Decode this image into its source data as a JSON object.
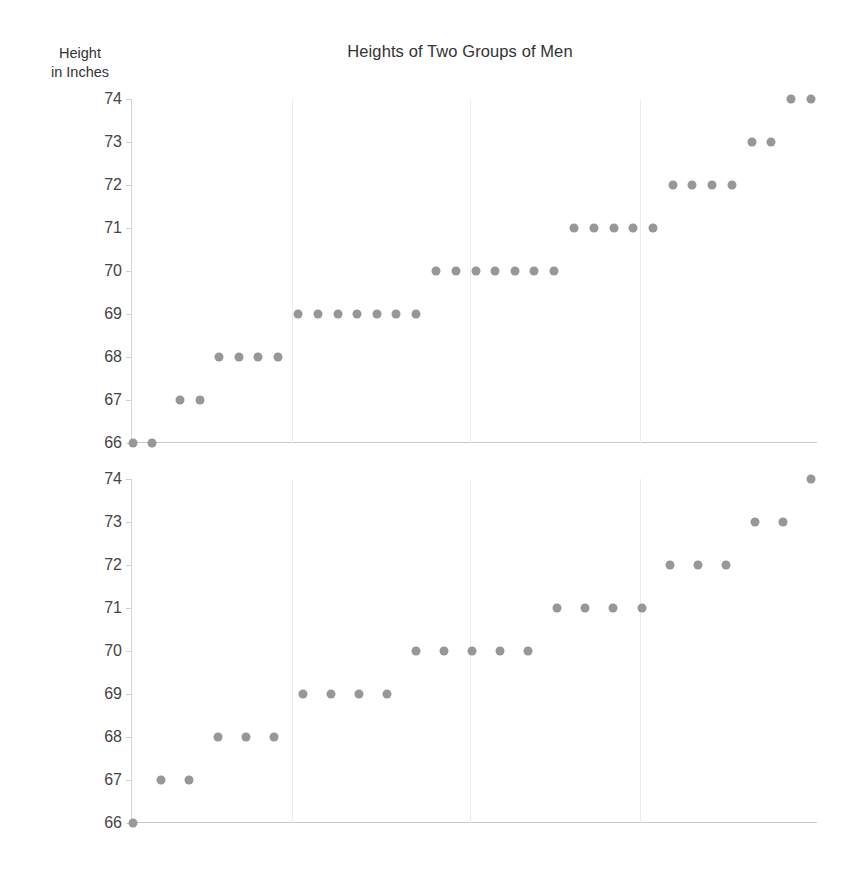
{
  "header": {
    "title": "Heights of Two Groups of Men",
    "y_axis_caption_line1": "Height",
    "y_axis_caption_line2": "in Inches"
  },
  "chart_data": [
    {
      "type": "scatter",
      "name": "group-1-dotplot",
      "title": "Heights of Two Groups of Men",
      "xlabel": "",
      "ylabel": "Height in Inches",
      "ylim": [
        66,
        74
      ],
      "yticks": [
        66,
        67,
        68,
        69,
        70,
        71,
        72,
        73,
        74
      ],
      "ytick_labels": [
        "66",
        "67",
        "68",
        "69",
        "70",
        "71",
        "72",
        "73",
        "74"
      ],
      "grid": "vertical",
      "gridline_x": [
        0.235,
        0.494,
        0.742
      ],
      "legend": "none",
      "point_color": "#979797",
      "n_points": 35,
      "value_counts": {
        "66": 2,
        "67": 2,
        "68": 4,
        "69": 7,
        "70": 7,
        "71": 5,
        "72": 4,
        "73": 2,
        "74": 2
      },
      "values": [
        66,
        66,
        67,
        67,
        68,
        68,
        68,
        68,
        69,
        69,
        69,
        69,
        69,
        69,
        69,
        70,
        70,
        70,
        70,
        70,
        70,
        70,
        71,
        71,
        71,
        71,
        71,
        72,
        72,
        72,
        72,
        73,
        73,
        74,
        74
      ],
      "points": [
        {
          "x": 0.0,
          "y": 66
        },
        {
          "x": 0.037,
          "y": 66
        },
        {
          "x": 0.09,
          "y": 67
        },
        {
          "x": 0.128,
          "y": 67
        },
        {
          "x": 0.164,
          "y": 68
        },
        {
          "x": 0.202,
          "y": 68
        },
        {
          "x": 0.239,
          "y": 68
        },
        {
          "x": 0.277,
          "y": 68
        },
        {
          "x": 0.315,
          "y": 69
        },
        {
          "x": 0.352,
          "y": 69
        },
        {
          "x": 0.39,
          "y": 69
        },
        {
          "x": 0.427,
          "y": 69
        },
        {
          "x": 0.465,
          "y": 69
        },
        {
          "x": 0.502,
          "y": 69
        },
        {
          "x": 0.54,
          "y": 69
        },
        {
          "x": 0.578,
          "y": 70
        },
        {
          "x": 0.615,
          "y": 70
        },
        {
          "x": 0.653,
          "y": 70
        },
        {
          "x": 0.69,
          "y": 70
        },
        {
          "x": 0.728,
          "y": 70
        },
        {
          "x": 0.765,
          "y": 70
        },
        {
          "x": 0.803,
          "y": 70
        },
        {
          "x": 0.841,
          "y": 71
        },
        {
          "x": 0.878,
          "y": 71
        },
        {
          "x": 0.916,
          "y": 71
        },
        {
          "x": 0.953,
          "y": 71
        },
        {
          "x": 0.991,
          "y": 71
        },
        {
          "x": 1.029,
          "y": 72
        },
        {
          "x": 1.066,
          "y": 72
        },
        {
          "x": 1.104,
          "y": 72
        },
        {
          "x": 1.141,
          "y": 72
        },
        {
          "x": 1.179,
          "y": 73
        },
        {
          "x": 1.216,
          "y": 73
        },
        {
          "x": 1.254,
          "y": 74
        },
        {
          "x": 1.292,
          "y": 74
        }
      ]
    },
    {
      "type": "scatter",
      "name": "group-2-dotplot",
      "title": "",
      "xlabel": "",
      "ylabel": "Height in Inches",
      "ylim": [
        66,
        74
      ],
      "yticks": [
        66,
        67,
        68,
        69,
        70,
        71,
        72,
        73,
        74
      ],
      "ytick_labels": [
        "66",
        "67",
        "68",
        "69",
        "70",
        "71",
        "72",
        "73",
        "74"
      ],
      "grid": "vertical",
      "gridline_x": [
        0.235,
        0.494,
        0.742
      ],
      "legend": "none",
      "point_color": "#979797",
      "n_points": 25,
      "value_counts": {
        "66": 1,
        "67": 2,
        "68": 3,
        "69": 4,
        "70": 5,
        "71": 4,
        "72": 3,
        "73": 2,
        "74": 1
      },
      "values": [
        66,
        67,
        67,
        68,
        68,
        68,
        69,
        69,
        69,
        69,
        70,
        70,
        70,
        70,
        70,
        71,
        71,
        71,
        71,
        72,
        72,
        72,
        73,
        73,
        74
      ],
      "points": [
        {
          "x": 0.0,
          "y": 66
        },
        {
          "x": 0.053,
          "y": 67
        },
        {
          "x": 0.105,
          "y": 67
        },
        {
          "x": 0.158,
          "y": 68
        },
        {
          "x": 0.211,
          "y": 68
        },
        {
          "x": 0.263,
          "y": 68
        },
        {
          "x": 0.316,
          "y": 69
        },
        {
          "x": 0.369,
          "y": 69
        },
        {
          "x": 0.421,
          "y": 69
        },
        {
          "x": 0.474,
          "y": 69
        },
        {
          "x": 0.527,
          "y": 70
        },
        {
          "x": 0.579,
          "y": 70
        },
        {
          "x": 0.632,
          "y": 70
        },
        {
          "x": 0.685,
          "y": 70
        },
        {
          "x": 0.737,
          "y": 70
        },
        {
          "x": 0.79,
          "y": 71
        },
        {
          "x": 0.843,
          "y": 71
        },
        {
          "x": 0.895,
          "y": 71
        },
        {
          "x": 0.948,
          "y": 71
        },
        {
          "x": 1.001,
          "y": 72
        },
        {
          "x": 1.053,
          "y": 72
        },
        {
          "x": 1.106,
          "y": 72
        },
        {
          "x": 1.159,
          "y": 73
        },
        {
          "x": 1.211,
          "y": 73
        },
        {
          "x": 1.264,
          "y": 74
        }
      ]
    }
  ]
}
